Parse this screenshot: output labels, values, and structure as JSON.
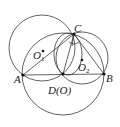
{
  "diagram": {
    "points": {
      "A": {
        "label": "A",
        "x": 23,
        "y": 75
      },
      "B": {
        "label": "B",
        "x": 104,
        "y": 74
      },
      "C": {
        "label": "C",
        "x": 74,
        "y": 34
      },
      "D": {
        "label": "D(O)",
        "x": 63,
        "y": 74
      },
      "O1": {
        "label": "O",
        "sub": "1",
        "x": 42,
        "y": 50
      },
      "O2": {
        "label": "O",
        "sub": "2",
        "x": 82,
        "y": 60
      }
    },
    "colors": {
      "stroke": "#3a3a3a",
      "point": "#111111"
    }
  }
}
